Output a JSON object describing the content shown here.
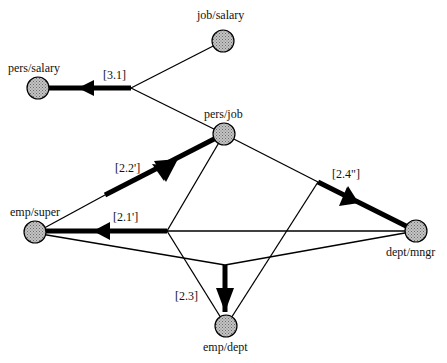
{
  "nodes": [
    {
      "id": "pers_salary",
      "label": "pers/salary",
      "x": 38,
      "y": 68
    },
    {
      "id": "job_salary",
      "label": "job/salary",
      "x": 223,
      "y": 41
    },
    {
      "id": "pers_job",
      "label": "pers/job",
      "x": 224,
      "y": 134
    },
    {
      "id": "emp_super",
      "label": "emp/super",
      "x": 35,
      "y": 233
    },
    {
      "id": "dept_mngr",
      "label": "dept/mngr",
      "x": 416,
      "y": 231
    },
    {
      "id": "emp_dept",
      "label": "emp/dept",
      "x": 226,
      "y": 326
    }
  ],
  "edge_labels": {
    "e31": "[3.1]",
    "e22": "[2.2']",
    "e21": "[2.1']",
    "e24": "[2.4\"]",
    "e23": "[2.3]"
  },
  "colors": {
    "node_fill": "#a8a8a8",
    "line": "#000000",
    "background": "#ffffff"
  }
}
